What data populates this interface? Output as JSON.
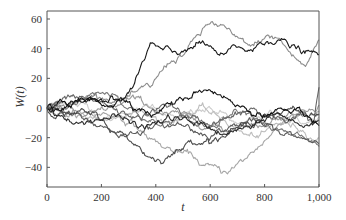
{
  "chart_data": {
    "type": "line",
    "title": "",
    "xlabel": "t",
    "ylabel": "W(t)",
    "xlim": [
      0,
      1000
    ],
    "ylim": [
      -53,
      65
    ],
    "x_ticks": [
      0,
      200,
      400,
      600,
      800,
      1000
    ],
    "x_tick_labels": [
      "0",
      "200",
      "400",
      "600",
      "800",
      "1,000"
    ],
    "y_ticks": [
      -40,
      -20,
      0,
      20,
      40,
      60
    ],
    "y_tick_labels": [
      "−40",
      "−20",
      "0",
      "20",
      "40",
      "60"
    ],
    "grid": false,
    "legend": null,
    "series": [
      {
        "name": "path-1",
        "color": "#8c8c8c",
        "waypoints": [
          [
            0,
            0
          ],
          [
            100,
            3
          ],
          [
            200,
            6
          ],
          [
            300,
            8
          ],
          [
            380,
            14
          ],
          [
            450,
            30
          ],
          [
            520,
            42
          ],
          [
            600,
            57
          ],
          [
            650,
            56
          ],
          [
            700,
            48
          ],
          [
            760,
            42
          ],
          [
            800,
            47
          ],
          [
            850,
            47
          ],
          [
            900,
            35
          ],
          [
            950,
            28
          ],
          [
            1000,
            46
          ]
        ]
      },
      {
        "name": "path-2",
        "color": "#1a1a1a",
        "waypoints": [
          [
            0,
            0
          ],
          [
            100,
            4
          ],
          [
            200,
            6
          ],
          [
            280,
            6
          ],
          [
            330,
            22
          ],
          [
            380,
            44
          ],
          [
            430,
            40
          ],
          [
            480,
            36
          ],
          [
            520,
            40
          ],
          [
            560,
            45
          ],
          [
            600,
            42
          ],
          [
            650,
            36
          ],
          [
            700,
            41
          ],
          [
            760,
            40
          ],
          [
            850,
            46
          ],
          [
            920,
            41
          ],
          [
            1000,
            36
          ]
        ]
      },
      {
        "name": "path-3",
        "color": "#111111",
        "waypoints": [
          [
            0,
            0
          ],
          [
            100,
            4
          ],
          [
            200,
            2
          ],
          [
            300,
            4
          ],
          [
            360,
            -2
          ],
          [
            400,
            -4
          ],
          [
            450,
            3
          ],
          [
            500,
            5
          ],
          [
            560,
            12
          ],
          [
            600,
            12
          ],
          [
            650,
            8
          ],
          [
            700,
            2
          ],
          [
            760,
            -5
          ],
          [
            800,
            -6
          ],
          [
            860,
            0
          ],
          [
            900,
            -3
          ],
          [
            960,
            -6
          ],
          [
            1000,
            -12
          ]
        ]
      },
      {
        "name": "path-4",
        "color": "#4d4d4d",
        "waypoints": [
          [
            0,
            0
          ],
          [
            60,
            -4
          ],
          [
            120,
            -2
          ],
          [
            200,
            -8
          ],
          [
            260,
            -16
          ],
          [
            320,
            -25
          ],
          [
            360,
            -32
          ],
          [
            400,
            -36
          ],
          [
            450,
            -33
          ],
          [
            500,
            -28
          ],
          [
            560,
            -24
          ],
          [
            620,
            -20
          ],
          [
            680,
            -14
          ],
          [
            740,
            -10
          ],
          [
            800,
            -4
          ],
          [
            860,
            -4
          ],
          [
            920,
            -2
          ],
          [
            960,
            -6
          ],
          [
            1000,
            -4
          ]
        ]
      },
      {
        "name": "path-5",
        "color": "#a6a6a6",
        "waypoints": [
          [
            0,
            0
          ],
          [
            80,
            -6
          ],
          [
            160,
            -4
          ],
          [
            240,
            -6
          ],
          [
            300,
            -10
          ],
          [
            360,
            -18
          ],
          [
            420,
            -26
          ],
          [
            480,
            -30
          ],
          [
            540,
            -34
          ],
          [
            600,
            -38
          ],
          [
            640,
            -44
          ],
          [
            680,
            -40
          ],
          [
            720,
            -36
          ],
          [
            760,
            -30
          ],
          [
            800,
            -22
          ],
          [
            840,
            -14
          ],
          [
            880,
            -8
          ],
          [
            920,
            -4
          ],
          [
            960,
            -6
          ],
          [
            1000,
            -2
          ]
        ]
      },
      {
        "name": "path-6",
        "color": "#595959",
        "waypoints": [
          [
            0,
            0
          ],
          [
            80,
            -2
          ],
          [
            160,
            -10
          ],
          [
            240,
            -16
          ],
          [
            300,
            -18
          ],
          [
            360,
            -14
          ],
          [
            420,
            -10
          ],
          [
            500,
            -12
          ],
          [
            560,
            -18
          ],
          [
            620,
            -16
          ],
          [
            680,
            -12
          ],
          [
            740,
            -8
          ],
          [
            800,
            -12
          ],
          [
            860,
            -18
          ],
          [
            920,
            -20
          ],
          [
            1000,
            -24
          ]
        ]
      },
      {
        "name": "path-7",
        "color": "#bdbdbd",
        "waypoints": [
          [
            0,
            0
          ],
          [
            100,
            -4
          ],
          [
            200,
            -8
          ],
          [
            260,
            -6
          ],
          [
            320,
            -2
          ],
          [
            380,
            -6
          ],
          [
            440,
            -10
          ],
          [
            500,
            -4
          ],
          [
            560,
            2
          ],
          [
            620,
            -4
          ],
          [
            680,
            -12
          ],
          [
            740,
            -18
          ],
          [
            800,
            -16
          ],
          [
            860,
            -10
          ],
          [
            920,
            -14
          ],
          [
            1000,
            -20
          ]
        ]
      },
      {
        "name": "path-8",
        "color": "#777777",
        "waypoints": [
          [
            0,
            0
          ],
          [
            60,
            4
          ],
          [
            140,
            6
          ],
          [
            200,
            10
          ],
          [
            260,
            8
          ],
          [
            300,
            0
          ],
          [
            360,
            -8
          ],
          [
            420,
            -12
          ],
          [
            480,
            -6
          ],
          [
            540,
            -10
          ],
          [
            600,
            -14
          ],
          [
            660,
            -6
          ],
          [
            720,
            -2
          ],
          [
            780,
            -8
          ],
          [
            840,
            -14
          ],
          [
            900,
            -18
          ],
          [
            960,
            -22
          ],
          [
            1000,
            -26
          ]
        ]
      },
      {
        "name": "path-9",
        "color": "#cccccc",
        "waypoints": [
          [
            0,
            0
          ],
          [
            80,
            2
          ],
          [
            160,
            -2
          ],
          [
            240,
            -8
          ],
          [
            300,
            -4
          ],
          [
            360,
            2
          ],
          [
            420,
            -2
          ],
          [
            480,
            -8
          ],
          [
            540,
            -4
          ],
          [
            600,
            0
          ],
          [
            660,
            -4
          ],
          [
            720,
            -10
          ],
          [
            780,
            -6
          ],
          [
            840,
            -2
          ],
          [
            900,
            -8
          ],
          [
            960,
            -10
          ],
          [
            1000,
            -6
          ]
        ]
      },
      {
        "name": "path-10",
        "color": "#2b2b2b",
        "waypoints": [
          [
            0,
            0
          ],
          [
            60,
            -6
          ],
          [
            120,
            -10
          ],
          [
            180,
            -8
          ],
          [
            240,
            -4
          ],
          [
            300,
            -8
          ],
          [
            360,
            -14
          ],
          [
            420,
            -10
          ],
          [
            480,
            -6
          ],
          [
            540,
            -12
          ],
          [
            600,
            -14
          ],
          [
            660,
            -18
          ],
          [
            720,
            -14
          ],
          [
            780,
            -10
          ],
          [
            840,
            -4
          ],
          [
            900,
            -8
          ],
          [
            960,
            -12
          ],
          [
            1000,
            -8
          ]
        ]
      },
      {
        "name": "path-11",
        "color": "#9a9a9a",
        "waypoints": [
          [
            0,
            0
          ],
          [
            60,
            2
          ],
          [
            120,
            -4
          ],
          [
            180,
            -2
          ],
          [
            240,
            2
          ],
          [
            300,
            6
          ],
          [
            360,
            2
          ],
          [
            420,
            -4
          ],
          [
            480,
            -2
          ],
          [
            540,
            -8
          ],
          [
            600,
            -12
          ],
          [
            660,
            -16
          ],
          [
            720,
            -10
          ],
          [
            780,
            -12
          ],
          [
            840,
            -8
          ],
          [
            900,
            -4
          ],
          [
            960,
            -2
          ],
          [
            1000,
            2
          ]
        ]
      },
      {
        "name": "path-12",
        "color": "#666666",
        "waypoints": [
          [
            0,
            0
          ],
          [
            50,
            4
          ],
          [
            100,
            8
          ],
          [
            160,
            6
          ],
          [
            220,
            2
          ],
          [
            280,
            -2
          ],
          [
            340,
            -6
          ],
          [
            400,
            -2
          ],
          [
            460,
            2
          ],
          [
            520,
            -6
          ],
          [
            580,
            -10
          ],
          [
            640,
            -8
          ],
          [
            700,
            -4
          ],
          [
            760,
            0
          ],
          [
            820,
            -6
          ],
          [
            880,
            -10
          ],
          [
            940,
            -4
          ],
          [
            980,
            -10
          ],
          [
            1000,
            14
          ]
        ]
      }
    ]
  },
  "plot_area": {
    "left": 47,
    "right": 319,
    "top": 11,
    "bottom": 187
  },
  "axis_color": "#555555"
}
